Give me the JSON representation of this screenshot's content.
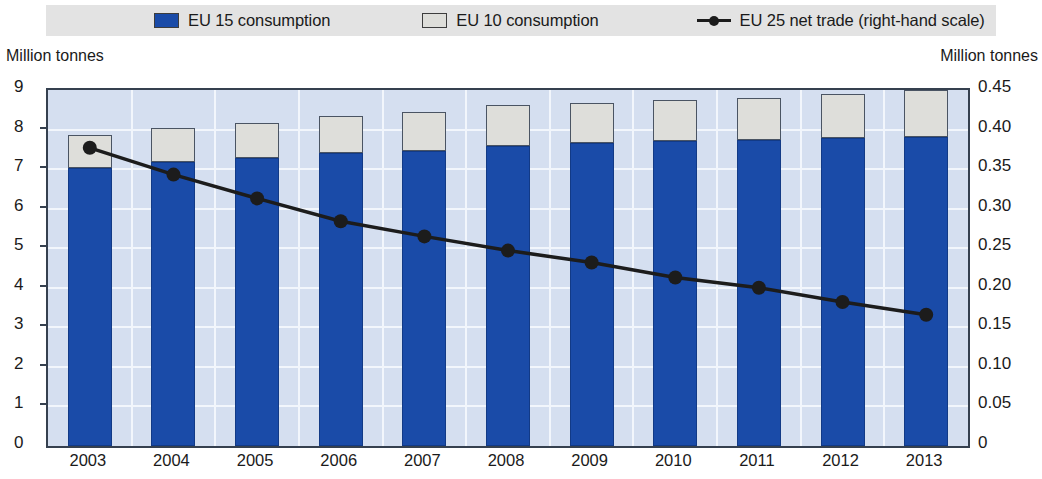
{
  "legend": {
    "items": [
      {
        "label": "EU 15 consumption",
        "marker": "blue-square-swatch"
      },
      {
        "label": "EU 10 consumption",
        "marker": "gray-square-swatch"
      },
      {
        "label": "EU 25 net trade (right-hand scale)",
        "marker": "black-line-dot-marker"
      }
    ]
  },
  "axes": {
    "left_unit": "Million tonnes",
    "right_unit": "Million tonnes",
    "left_ticks": [
      "9",
      "8",
      "7",
      "6",
      "5",
      "4",
      "3",
      "2",
      "1",
      "0"
    ],
    "right_ticks": [
      "0.45",
      "0.40",
      "0.35",
      "0.30",
      "0.25",
      "0.20",
      "0.15",
      "0.10",
      "0.05",
      "0"
    ]
  },
  "colors": {
    "eu15_blue": "#1a4ba8",
    "eu10_gray": "#dededa",
    "net_trade_line": "#1c1c1c",
    "plot_background": "#d5dff0",
    "gridline": "#f2f6fc",
    "legend_background": "#e3e3e3",
    "frame": "#35404f"
  },
  "chart_data": {
    "type": "bar",
    "title": "",
    "subtitle": "",
    "xlabel": "",
    "ylabel": "Million tonnes",
    "y2label": "Million tonnes",
    "ylim": [
      0,
      9
    ],
    "y2lim": [
      0,
      0.45
    ],
    "grid": true,
    "legend_position": "top",
    "stacked": true,
    "categories": [
      "2003",
      "2004",
      "2005",
      "2006",
      "2007",
      "2008",
      "2009",
      "2010",
      "2011",
      "2012",
      "2013"
    ],
    "series": [
      {
        "name": "EU 15 consumption",
        "axis": "left",
        "type": "bar",
        "color": "#1a4ba8",
        "values": [
          7.02,
          7.18,
          7.28,
          7.4,
          7.46,
          7.58,
          7.65,
          7.7,
          7.74,
          7.78,
          7.82
        ]
      },
      {
        "name": "EU 10 consumption",
        "axis": "left",
        "type": "bar",
        "color": "#dededa",
        "values": [
          0.83,
          0.85,
          0.88,
          0.95,
          0.98,
          1.03,
          1.03,
          1.05,
          1.07,
          1.12,
          1.17
        ]
      },
      {
        "name": "EU 25 net trade (right-hand scale)",
        "axis": "right",
        "type": "line",
        "color": "#1c1c1c",
        "values": [
          0.377,
          0.343,
          0.313,
          0.284,
          0.265,
          0.247,
          0.232,
          0.213,
          0.2,
          0.182,
          0.166
        ]
      }
    ],
    "totals": [
      7.85,
      8.03,
      8.16,
      8.35,
      8.44,
      8.61,
      8.68,
      8.75,
      8.81,
      8.9,
      8.99
    ]
  }
}
